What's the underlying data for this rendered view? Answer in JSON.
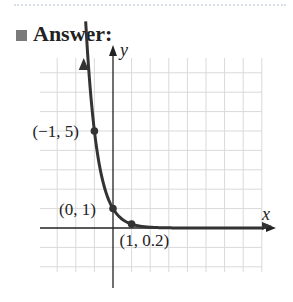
{
  "heading": {
    "label": "Answer:"
  },
  "chart_data": {
    "type": "line",
    "title": "",
    "function": "y = 5^(-x) = (1/5)^x",
    "xlabel": "x",
    "ylabel": "y",
    "grid": true,
    "xlim": [
      -3,
      8
    ],
    "ylim": [
      -2,
      8
    ],
    "labeled_points": [
      {
        "x": -1,
        "y": 5,
        "label": "(−1, 5)"
      },
      {
        "x": 0,
        "y": 1,
        "label": "(0, 1)"
      },
      {
        "x": 1,
        "y": 0.2,
        "label": "(1, 0.2)"
      }
    ],
    "colors": {
      "curve": "#333333",
      "grid": "#d9d9d9",
      "axis": "#222222"
    }
  }
}
